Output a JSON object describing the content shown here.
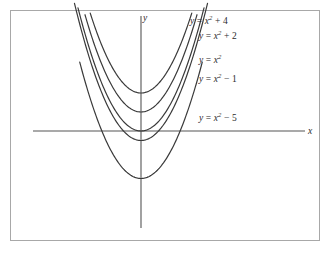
{
  "figure": {
    "background_color": "#ffffff",
    "frame_color": "#a8a8a8",
    "curve_color": "#3a3a3a",
    "axis_color": "#555555",
    "text_color": "#2b2b2b"
  },
  "axes": {
    "x_label": "x",
    "y_label": "y"
  },
  "labels": {
    "c4": {
      "lhs": "y",
      "eq": " = ",
      "base": "x",
      "exp": "2",
      "tail": " + 4"
    },
    "c2": {
      "lhs": "y",
      "eq": " = ",
      "base": "x",
      "exp": "2",
      "tail": " + 2"
    },
    "c0": {
      "lhs": "y",
      "eq": " = ",
      "base": "x",
      "exp": "2",
      "tail": ""
    },
    "cm1": {
      "lhs": "y",
      "eq": " = ",
      "base": "x",
      "exp": "2",
      "tail": " − 1"
    },
    "cm5": {
      "lhs": "y",
      "eq": " = ",
      "base": "x",
      "exp": "2",
      "tail": " − 5"
    }
  },
  "chart_data": {
    "type": "line",
    "title": "",
    "xlabel": "x",
    "ylabel": "y",
    "grid": false,
    "legend_position": "inline-right",
    "annotations": [
      "y = x² + 4",
      "y = x² + 2",
      "y = x²",
      "y = x² − 1",
      "y = x² − 5"
    ],
    "xlim": [
      -5,
      5
    ],
    "ylim": [
      -6,
      12
    ],
    "x": [
      -4.8,
      -4.4,
      -4.0,
      -3.6,
      -3.2,
      -2.8,
      -2.4,
      -2.0,
      -1.6,
      -1.2,
      -0.8,
      -0.4,
      0,
      0.4,
      0.8,
      1.2,
      1.6,
      2.0,
      2.4,
      2.8,
      3.2,
      3.6,
      4.0,
      4.4,
      4.8
    ],
    "series": [
      {
        "name": "y = x² + 4",
        "c": 4,
        "vertex": [
          0,
          4
        ],
        "x_domain": [
          -2.9,
          2.9
        ],
        "values": [
          27.04,
          23.36,
          20.0,
          16.96,
          14.24,
          11.84,
          9.76,
          8.0,
          6.56,
          5.44,
          4.64,
          4.16,
          4.0,
          4.16,
          4.64,
          5.44,
          6.56,
          8.0,
          9.76,
          11.84,
          14.24,
          16.96,
          20.0,
          23.36,
          27.04
        ]
      },
      {
        "name": "y = x² + 2",
        "c": 2,
        "vertex": [
          0,
          2
        ],
        "x_domain": [
          -3.2,
          3.2
        ],
        "values": [
          25.04,
          21.36,
          18.0,
          14.96,
          12.24,
          9.84,
          7.76,
          6.0,
          4.56,
          3.44,
          2.64,
          2.16,
          2.0,
          2.16,
          2.64,
          3.44,
          4.56,
          6.0,
          7.76,
          9.84,
          12.24,
          14.96,
          18.0,
          21.36,
          25.04
        ]
      },
      {
        "name": "y = x²",
        "c": 0,
        "vertex": [
          0,
          0
        ],
        "x_domain": [
          -3.6,
          3.6
        ],
        "values": [
          23.04,
          19.36,
          16.0,
          12.96,
          10.24,
          7.84,
          5.76,
          4.0,
          2.56,
          1.44,
          0.64,
          0.16,
          0.0,
          0.16,
          0.64,
          1.44,
          2.56,
          4.0,
          5.76,
          7.84,
          10.24,
          12.96,
          16.0,
          19.36,
          23.04
        ]
      },
      {
        "name": "y = x² − 1",
        "c": -1,
        "vertex": [
          0,
          -1
        ],
        "x_domain": [
          -3.8,
          3.8
        ],
        "values": [
          22.04,
          18.36,
          15.0,
          11.96,
          9.24,
          6.84,
          4.76,
          3.0,
          1.56,
          0.44,
          -0.36,
          -0.84,
          -1.0,
          -0.84,
          -0.36,
          0.44,
          1.56,
          3.0,
          4.76,
          6.84,
          9.24,
          11.96,
          15.0,
          18.36,
          22.04
        ]
      },
      {
        "name": "y = x² − 5",
        "c": -5,
        "vertex": [
          0,
          -5
        ],
        "x_domain": [
          -3.5,
          3.5
        ],
        "values": [
          18.04,
          14.36,
          11.0,
          7.96,
          5.24,
          2.84,
          0.76,
          -1.0,
          -2.44,
          -3.56,
          -4.36,
          -4.84,
          -5.0,
          -4.84,
          -4.36,
          -3.56,
          -2.44,
          -1.0,
          0.76,
          2.84,
          5.24,
          7.96,
          11.0,
          14.36,
          18.04
        ]
      }
    ]
  }
}
